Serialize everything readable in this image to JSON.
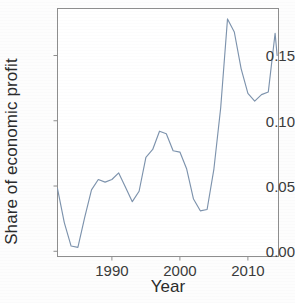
{
  "chart_data": {
    "type": "line",
    "title": "",
    "xlabel": "Year",
    "ylabel": "Share of economic profit",
    "xlim": [
      1982,
      2014.5
    ],
    "ylim": [
      -0.004,
      0.186
    ],
    "xticks": [
      1990,
      2000,
      2010
    ],
    "xtick_labels": [
      "1990",
      "2000",
      "2010"
    ],
    "yticks": [
      0.0,
      0.05,
      0.1,
      0.15
    ],
    "ytick_labels": [
      "0.00",
      "0.05",
      "0.10",
      "0.15"
    ],
    "grid": false,
    "legend": false,
    "line_color": "#7d93ad",
    "frame_color": "#8a8a8a",
    "x": [
      1982,
      1983,
      1984,
      1985,
      1986,
      1987,
      1988,
      1989,
      1990,
      1991,
      1992,
      1993,
      1994,
      1995,
      1996,
      1997,
      1998,
      1999,
      2000,
      2001,
      2002,
      2003,
      2004,
      2005,
      2006,
      2007,
      2008,
      2009,
      2010,
      2011,
      2012,
      2013,
      2014
    ],
    "values": [
      0.048,
      0.022,
      0.004,
      0.003,
      0.026,
      0.047,
      0.055,
      0.053,
      0.055,
      0.06,
      0.049,
      0.038,
      0.046,
      0.072,
      0.078,
      0.092,
      0.09,
      0.077,
      0.076,
      0.063,
      0.04,
      0.031,
      0.032,
      0.063,
      0.11,
      0.178,
      0.168,
      0.14,
      0.121,
      0.115,
      0.12,
      0.122,
      0.167
    ],
    "final_value": 0.15,
    "series_name": "Share of economic profit"
  }
}
